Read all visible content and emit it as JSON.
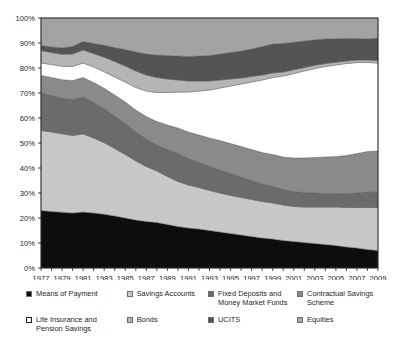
{
  "chart_data": {
    "type": "area",
    "stacked": true,
    "normalized": true,
    "title": "",
    "subtitle": "",
    "xlabel": "",
    "ylabel": "",
    "grid": false,
    "legend_position": "bottom",
    "ylim": [
      0,
      100
    ],
    "ytick_labels": [
      "0%",
      "10%",
      "20%",
      "30%",
      "40%",
      "50%",
      "60%",
      "70%",
      "80%",
      "90%",
      "100%"
    ],
    "ytick_values": [
      0,
      10,
      20,
      30,
      40,
      50,
      60,
      70,
      80,
      90,
      100
    ],
    "xtick_labels": [
      "1977",
      "1979",
      "1981",
      "1983",
      "1985",
      "1987",
      "1989",
      "1991",
      "1993",
      "1995",
      "1997",
      "1999",
      "2001",
      "2003",
      "2005",
      "2007",
      "2009"
    ],
    "x": [
      1977,
      1978,
      1979,
      1980,
      1981,
      1982,
      1983,
      1984,
      1985,
      1986,
      1987,
      1988,
      1989,
      1990,
      1991,
      1992,
      1993,
      1994,
      1995,
      1996,
      1997,
      1998,
      1999,
      2000,
      2001,
      2002,
      2003,
      2004,
      2005,
      2006,
      2007,
      2008,
      2009
    ],
    "series": [
      {
        "name": "Means of Payment",
        "color": "#0d0d0d",
        "swatch_style": "solid-black",
        "values": [
          23.0,
          22.6,
          22.3,
          22.0,
          22.4,
          22.0,
          21.5,
          20.8,
          20.0,
          19.2,
          18.6,
          18.2,
          17.4,
          16.6,
          16.0,
          15.6,
          15.0,
          14.4,
          13.8,
          13.2,
          12.6,
          12.0,
          11.6,
          11.0,
          10.6,
          10.2,
          9.8,
          9.4,
          9.0,
          8.4,
          8.0,
          7.4,
          7.0
        ]
      },
      {
        "name": "Savings Accounts",
        "color": "#c8c8c8",
        "swatch_style": "light-outline",
        "values": [
          32.0,
          31.8,
          31.4,
          31.0,
          31.2,
          30.0,
          28.6,
          27.0,
          25.4,
          23.6,
          22.0,
          20.6,
          19.2,
          18.0,
          17.2,
          16.6,
          16.0,
          15.6,
          15.2,
          15.0,
          14.8,
          14.6,
          14.4,
          14.2,
          14.0,
          14.2,
          14.6,
          15.0,
          15.4,
          15.8,
          16.2,
          16.8,
          17.2
        ]
      },
      {
        "name": "Fixed Deposits and Money Market Funds",
        "color": "#6b6b6b",
        "swatch_style": "dark",
        "values": [
          15.0,
          14.6,
          14.2,
          14.4,
          14.8,
          14.2,
          13.6,
          13.0,
          12.4,
          11.6,
          11.0,
          10.4,
          10.8,
          11.2,
          10.6,
          10.0,
          9.6,
          9.2,
          8.8,
          8.2,
          7.6,
          7.0,
          6.6,
          6.2,
          6.0,
          5.8,
          5.6,
          5.4,
          5.2,
          5.4,
          5.8,
          6.2,
          6.0
        ]
      },
      {
        "name": "Contractual Savings Scheme",
        "color": "#8a8a8a",
        "swatch_style": "medium",
        "values": [
          7.0,
          7.2,
          7.4,
          7.6,
          7.8,
          8.0,
          8.2,
          8.4,
          8.6,
          8.8,
          9.0,
          9.4,
          9.8,
          10.2,
          10.6,
          11.0,
          11.4,
          11.8,
          12.0,
          12.2,
          12.4,
          12.6,
          12.8,
          13.0,
          13.4,
          13.8,
          14.2,
          14.6,
          15.0,
          15.4,
          15.8,
          16.2,
          16.6
        ]
      },
      {
        "name": "Life Insurance and Pension Savings",
        "color": "#ffffff",
        "swatch_style": "white-outline",
        "values": [
          5.0,
          5.2,
          5.4,
          5.6,
          5.8,
          6.2,
          6.6,
          7.2,
          8.0,
          9.0,
          10.2,
          11.6,
          13.0,
          14.4,
          16.0,
          17.6,
          19.2,
          21.0,
          23.0,
          25.0,
          27.0,
          29.0,
          30.8,
          32.4,
          33.8,
          34.8,
          35.6,
          36.2,
          36.6,
          36.8,
          36.4,
          35.6,
          35.2
        ]
      },
      {
        "name": "Bonds",
        "color": "#b5b5b5",
        "swatch_style": "light-dotted",
        "values": [
          5.0,
          4.8,
          4.8,
          5.0,
          5.2,
          5.4,
          5.8,
          6.2,
          6.4,
          6.6,
          6.4,
          6.0,
          5.4,
          4.8,
          4.4,
          4.0,
          3.6,
          3.2,
          2.8,
          2.4,
          2.2,
          2.0,
          1.8,
          1.6,
          1.5,
          1.4,
          1.3,
          1.2,
          1.1,
          1.0,
          1.0,
          1.0,
          1.0
        ]
      },
      {
        "name": "UCITS",
        "color": "#545454",
        "swatch_style": "very-dark",
        "values": [
          2.0,
          2.2,
          2.6,
          3.0,
          3.4,
          4.0,
          4.8,
          5.6,
          6.6,
          7.6,
          8.4,
          9.0,
          9.4,
          9.6,
          9.8,
          10.0,
          10.2,
          10.4,
          10.6,
          10.8,
          11.0,
          11.4,
          11.6,
          11.4,
          11.0,
          10.6,
          10.2,
          9.8,
          9.4,
          9.0,
          8.6,
          8.4,
          9.0
        ]
      },
      {
        "name": "Equities",
        "color": "#a3a3a3",
        "swatch_style": "medium-dotted",
        "values": [
          11.0,
          11.6,
          11.9,
          11.4,
          9.4,
          10.2,
          10.9,
          11.8,
          12.6,
          13.6,
          14.4,
          14.8,
          15.0,
          15.2,
          15.4,
          15.2,
          15.0,
          14.4,
          13.8,
          13.2,
          12.4,
          11.4,
          10.4,
          10.2,
          9.7,
          9.2,
          8.7,
          8.4,
          8.3,
          8.2,
          8.2,
          8.4,
          8.0
        ]
      }
    ]
  },
  "legend": {
    "rows": [
      [
        {
          "label": "Means of Payment",
          "series": 0
        },
        {
          "label": "Savings Accounts",
          "series": 1
        },
        {
          "label": "Fixed Deposits and Money Market Funds",
          "series": 2
        },
        {
          "label": "Contractual Savings Scheme",
          "series": 3
        }
      ],
      [
        {
          "label": "Life Insurance and Pension Savings",
          "series": 4
        },
        {
          "label": "Bonds",
          "series": 5
        },
        {
          "label": "UCITS",
          "series": 6
        },
        {
          "label": "Equities",
          "series": 7
        }
      ]
    ]
  },
  "style": {
    "frame_color": "#231f20",
    "tick_color": "#231f20",
    "background": "#ffffff"
  }
}
